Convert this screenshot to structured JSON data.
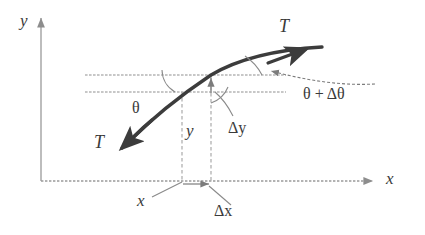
{
  "figure": {
    "type": "physics-diagram",
    "background_color": "#ffffff",
    "ink_color": "#4a4a4a",
    "curve_color": "#3c3c3c"
  },
  "axes": {
    "y_label": "y",
    "x_label": "x",
    "origin": {
      "x": 41,
      "y": 181
    },
    "y_axis_top": {
      "x": 41,
      "y": 14
    },
    "x_axis_right": {
      "x": 378,
      "y": 181
    }
  },
  "labels": {
    "tension_upper": "T",
    "tension_lower": "T",
    "angle_theta": "θ",
    "angle_theta_plus_delta": "θ + Δθ",
    "delta_y": "Δy",
    "delta_x": "Δx",
    "y_offset": "y",
    "x_offset": "x"
  },
  "reference_lines": {
    "upper": {
      "x1": 85,
      "y1": 75,
      "x2": 286,
      "y2": 75
    },
    "lower": {
      "x1": 85,
      "y1": 92,
      "x2": 286,
      "y2": 92
    }
  },
  "dashed_verticals": {
    "left": {
      "x": 182,
      "y_top": 92,
      "y_bottom": 181
    },
    "right": {
      "x": 211,
      "y_top": 75,
      "y_bottom": 181
    }
  },
  "curve": {
    "start": {
      "x": 120,
      "y": 150
    },
    "mid_left": {
      "x": 182,
      "y": 92
    },
    "crossing": {
      "x": 211,
      "y": 75
    },
    "end": {
      "x": 315,
      "y": 52
    }
  },
  "markers": {
    "delta_y_arrow": {
      "x": 211,
      "y_from": 92,
      "y_to": 76
    },
    "delta_x_arrow": {
      "y": 184,
      "x_from": 183,
      "x_to": 212
    }
  }
}
